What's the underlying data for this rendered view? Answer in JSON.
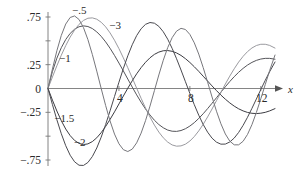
{
  "chart_data": {
    "type": "line",
    "title": "",
    "subtitle": "",
    "xlabel": "x",
    "ylabel": "",
    "grid": false,
    "legend_position": "inline-curve-labels",
    "xlim": [
      0,
      12.8
    ],
    "ylim": [
      -0.85,
      0.85
    ],
    "x_ticks": [
      4,
      8,
      12
    ],
    "x_tick_labels": [
      "4",
      "8",
      "12"
    ],
    "y_ticks": [
      0.75,
      0.25,
      0,
      -0.25,
      -0.75
    ],
    "y_tick_labels": [
      ".75",
      ".25",
      "0",
      "-.25",
      "-.75"
    ],
    "y_minor_ticks": [
      0.5,
      -0.5
    ],
    "axis_arrow": true,
    "annotations": [
      {
        "text": "-.5",
        "x": 1.35,
        "y": 0.78
      },
      {
        "text": "-3",
        "x": 3.45,
        "y": 0.62
      },
      {
        "text": "-1",
        "x": 0.62,
        "y": 0.28
      },
      {
        "text": "-1.5",
        "x": 0.35,
        "y": -0.35
      },
      {
        "text": "-2",
        "x": 1.45,
        "y": -0.6
      }
    ],
    "series": [
      {
        "name": "-.5",
        "label": "-.5",
        "color": "#55555a",
        "order": -0.5,
        "points": [
          [
            0.0,
            0.0
          ],
          [
            0.25,
            0.178
          ],
          [
            0.5,
            0.318
          ],
          [
            0.75,
            0.428
          ],
          [
            1.0,
            0.514
          ],
          [
            1.25,
            0.578
          ],
          [
            1.5,
            0.622
          ],
          [
            1.75,
            0.648
          ],
          [
            2.0,
            0.657
          ],
          [
            2.25,
            0.65
          ],
          [
            2.5,
            0.629
          ],
          [
            2.75,
            0.594
          ],
          [
            3.0,
            0.547
          ],
          [
            3.25,
            0.489
          ],
          [
            3.5,
            0.422
          ],
          [
            3.75,
            0.347
          ],
          [
            4.0,
            0.267
          ],
          [
            4.25,
            0.184
          ],
          [
            4.5,
            0.099
          ],
          [
            4.75,
            0.015
          ],
          [
            5.0,
            -0.067
          ],
          [
            5.25,
            -0.144
          ],
          [
            5.5,
            -0.215
          ],
          [
            5.75,
            -0.278
          ],
          [
            6.0,
            -0.333
          ],
          [
            6.25,
            -0.378
          ],
          [
            6.5,
            -0.412
          ],
          [
            6.75,
            -0.436
          ],
          [
            7.0,
            -0.448
          ],
          [
            7.25,
            -0.45
          ],
          [
            7.5,
            -0.441
          ],
          [
            7.75,
            -0.422
          ],
          [
            8.0,
            -0.394
          ],
          [
            8.25,
            -0.358
          ],
          [
            8.5,
            -0.314
          ],
          [
            8.75,
            -0.265
          ],
          [
            9.0,
            -0.211
          ],
          [
            9.25,
            -0.155
          ],
          [
            9.5,
            -0.097
          ],
          [
            9.75,
            -0.039
          ],
          [
            10.0,
            0.018
          ],
          [
            10.25,
            0.073
          ],
          [
            10.5,
            0.124
          ],
          [
            10.75,
            0.17
          ],
          [
            11.0,
            0.211
          ],
          [
            11.25,
            0.246
          ],
          [
            11.5,
            0.274
          ],
          [
            11.75,
            0.295
          ],
          [
            12.0,
            0.309
          ],
          [
            12.25,
            0.316
          ],
          [
            12.5,
            0.316
          ],
          [
            12.8,
            0.307
          ]
        ]
      },
      {
        "name": "-1",
        "label": "-1",
        "color": "#9a9a9f",
        "order": -1,
        "points": [
          [
            0.0,
            0.0
          ],
          [
            0.25,
            0.121
          ],
          [
            0.5,
            0.238
          ],
          [
            0.75,
            0.349
          ],
          [
            1.0,
            0.45
          ],
          [
            1.25,
            0.539
          ],
          [
            1.5,
            0.614
          ],
          [
            1.75,
            0.673
          ],
          [
            2.0,
            0.714
          ],
          [
            2.25,
            0.737
          ],
          [
            2.5,
            0.741
          ],
          [
            2.75,
            0.727
          ],
          [
            3.0,
            0.695
          ],
          [
            3.25,
            0.647
          ],
          [
            3.5,
            0.583
          ],
          [
            3.75,
            0.506
          ],
          [
            4.0,
            0.418
          ],
          [
            4.25,
            0.321
          ],
          [
            4.5,
            0.218
          ],
          [
            4.75,
            0.111
          ],
          [
            5.0,
            0.003
          ],
          [
            5.25,
            -0.103
          ],
          [
            5.5,
            -0.205
          ],
          [
            5.75,
            -0.299
          ],
          [
            6.0,
            -0.384
          ],
          [
            6.25,
            -0.457
          ],
          [
            6.5,
            -0.517
          ],
          [
            6.75,
            -0.562
          ],
          [
            7.0,
            -0.592
          ],
          [
            7.25,
            -0.605
          ],
          [
            7.5,
            -0.602
          ],
          [
            7.75,
            -0.584
          ],
          [
            8.0,
            -0.551
          ],
          [
            8.25,
            -0.504
          ],
          [
            8.5,
            -0.445
          ],
          [
            8.75,
            -0.376
          ],
          [
            9.0,
            -0.298
          ],
          [
            9.25,
            -0.215
          ],
          [
            9.5,
            -0.128
          ],
          [
            9.75,
            -0.04
          ],
          [
            10.0,
            0.047
          ],
          [
            10.25,
            0.13
          ],
          [
            10.5,
            0.207
          ],
          [
            10.75,
            0.277
          ],
          [
            11.0,
            0.337
          ],
          [
            11.25,
            0.387
          ],
          [
            11.5,
            0.425
          ],
          [
            11.75,
            0.451
          ],
          [
            12.0,
            0.464
          ],
          [
            12.25,
            0.464
          ],
          [
            12.5,
            0.452
          ],
          [
            12.8,
            0.424
          ]
        ]
      },
      {
        "name": "-1.5",
        "label": "-1.5",
        "color": "#3c3c42",
        "order": -1.5,
        "points": [
          [
            0.0,
            0.0
          ],
          [
            0.25,
            -0.122
          ],
          [
            0.5,
            -0.236
          ],
          [
            0.75,
            -0.338
          ],
          [
            1.0,
            -0.425
          ],
          [
            1.25,
            -0.494
          ],
          [
            1.5,
            -0.545
          ],
          [
            1.75,
            -0.576
          ],
          [
            2.0,
            -0.588
          ],
          [
            2.25,
            -0.581
          ],
          [
            2.5,
            -0.557
          ],
          [
            2.75,
            -0.517
          ],
          [
            3.0,
            -0.463
          ],
          [
            3.25,
            -0.398
          ],
          [
            3.5,
            -0.324
          ],
          [
            3.75,
            -0.245
          ],
          [
            4.0,
            -0.162
          ],
          [
            4.25,
            -0.079
          ],
          [
            4.5,
            0.003
          ],
          [
            4.75,
            0.081
          ],
          [
            5.0,
            0.154
          ],
          [
            5.25,
            0.219
          ],
          [
            5.5,
            0.275
          ],
          [
            5.75,
            0.322
          ],
          [
            6.0,
            0.358
          ],
          [
            6.25,
            0.382
          ],
          [
            6.5,
            0.396
          ],
          [
            6.75,
            0.398
          ],
          [
            7.0,
            0.39
          ],
          [
            7.25,
            0.373
          ],
          [
            7.5,
            0.347
          ],
          [
            7.75,
            0.313
          ],
          [
            8.0,
            0.273
          ],
          [
            8.25,
            0.228
          ],
          [
            8.5,
            0.18
          ],
          [
            8.75,
            0.129
          ],
          [
            9.0,
            0.078
          ],
          [
            9.25,
            0.027
          ],
          [
            9.5,
            -0.022
          ],
          [
            9.75,
            -0.069
          ],
          [
            10.0,
            -0.112
          ],
          [
            10.25,
            -0.151
          ],
          [
            10.5,
            -0.185
          ],
          [
            10.75,
            -0.213
          ],
          [
            11.0,
            -0.235
          ],
          [
            11.25,
            -0.251
          ],
          [
            11.5,
            -0.26
          ],
          [
            11.75,
            -0.263
          ],
          [
            12.0,
            -0.259
          ],
          [
            12.25,
            -0.25
          ],
          [
            12.5,
            -0.235
          ],
          [
            12.8,
            -0.211
          ]
        ]
      },
      {
        "name": "-2",
        "label": "-2",
        "color": "#4a4a50",
        "order": -2,
        "points": [
          [
            0.0,
            0.0
          ],
          [
            0.25,
            -0.168
          ],
          [
            0.5,
            -0.328
          ],
          [
            0.75,
            -0.474
          ],
          [
            1.0,
            -0.6
          ],
          [
            1.25,
            -0.7
          ],
          [
            1.5,
            -0.769
          ],
          [
            1.75,
            -0.805
          ],
          [
            2.0,
            -0.807
          ],
          [
            2.25,
            -0.776
          ],
          [
            2.5,
            -0.714
          ],
          [
            2.75,
            -0.624
          ],
          [
            3.0,
            -0.51
          ],
          [
            3.25,
            -0.378
          ],
          [
            3.5,
            -0.234
          ],
          [
            3.75,
            -0.084
          ],
          [
            4.0,
            0.066
          ],
          [
            4.25,
            0.21
          ],
          [
            4.5,
            0.343
          ],
          [
            4.75,
            0.459
          ],
          [
            5.0,
            0.555
          ],
          [
            5.25,
            0.627
          ],
          [
            5.5,
            0.673
          ],
          [
            5.75,
            0.692
          ],
          [
            6.0,
            0.685
          ],
          [
            6.25,
            0.652
          ],
          [
            6.5,
            0.595
          ],
          [
            6.75,
            0.517
          ],
          [
            7.0,
            0.421
          ],
          [
            7.25,
            0.312
          ],
          [
            7.5,
            0.194
          ],
          [
            7.75,
            0.071
          ],
          [
            8.0,
            -0.052
          ],
          [
            8.25,
            -0.17
          ],
          [
            8.5,
            -0.28
          ],
          [
            8.75,
            -0.377
          ],
          [
            9.0,
            -0.458
          ],
          [
            9.25,
            -0.521
          ],
          [
            9.5,
            -0.563
          ],
          [
            9.75,
            -0.584
          ],
          [
            10.0,
            -0.583
          ],
          [
            10.25,
            -0.561
          ],
          [
            10.5,
            -0.52
          ],
          [
            10.75,
            -0.461
          ],
          [
            11.0,
            -0.387
          ],
          [
            11.25,
            -0.302
          ],
          [
            11.5,
            -0.208
          ],
          [
            11.75,
            -0.11
          ],
          [
            12.0,
            -0.011
          ],
          [
            12.25,
            0.086
          ],
          [
            12.5,
            0.177
          ],
          [
            12.8,
            0.278
          ]
        ]
      },
      {
        "name": "-3",
        "label": "-3",
        "color": "#77777c",
        "order": -3,
        "points": [
          [
            0.0,
            0.0
          ],
          [
            0.25,
            0.205
          ],
          [
            0.5,
            0.396
          ],
          [
            0.75,
            0.557
          ],
          [
            1.0,
            0.676
          ],
          [
            1.25,
            0.745
          ],
          [
            1.5,
            0.761
          ],
          [
            1.75,
            0.724
          ],
          [
            2.0,
            0.639
          ],
          [
            2.25,
            0.513
          ],
          [
            2.5,
            0.357
          ],
          [
            2.75,
            0.182
          ],
          [
            3.0,
            0.0
          ],
          [
            3.25,
            -0.178
          ],
          [
            3.5,
            -0.341
          ],
          [
            3.75,
            -0.478
          ],
          [
            4.0,
            -0.58
          ],
          [
            4.25,
            -0.642
          ],
          [
            4.5,
            -0.661
          ],
          [
            4.75,
            -0.636
          ],
          [
            5.0,
            -0.57
          ],
          [
            5.25,
            -0.468
          ],
          [
            5.5,
            -0.337
          ],
          [
            5.75,
            -0.185
          ],
          [
            6.0,
            -0.022
          ],
          [
            6.25,
            0.142
          ],
          [
            6.5,
            0.296
          ],
          [
            6.75,
            0.429
          ],
          [
            7.0,
            0.533
          ],
          [
            7.25,
            0.602
          ],
          [
            7.5,
            0.631
          ],
          [
            7.75,
            0.619
          ],
          [
            8.0,
            0.567
          ],
          [
            8.25,
            0.479
          ],
          [
            8.5,
            0.361
          ],
          [
            8.75,
            0.22
          ],
          [
            9.0,
            0.067
          ],
          [
            9.25,
            -0.089
          ],
          [
            9.5,
            -0.238
          ],
          [
            9.75,
            -0.37
          ],
          [
            10.0,
            -0.477
          ],
          [
            10.25,
            -0.552
          ],
          [
            10.5,
            -0.591
          ],
          [
            10.75,
            -0.591
          ],
          [
            11.0,
            -0.554
          ],
          [
            11.25,
            -0.482
          ],
          [
            11.5,
            -0.379
          ],
          [
            11.75,
            -0.251
          ],
          [
            12.0,
            -0.108
          ],
          [
            12.25,
            0.042
          ],
          [
            12.5,
            0.189
          ],
          [
            12.8,
            0.351
          ]
        ]
      }
    ]
  }
}
